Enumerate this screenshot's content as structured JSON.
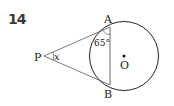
{
  "problem": {
    "number": "14"
  },
  "figure": {
    "points": {
      "P": "P",
      "A": "A",
      "B": "B",
      "O": "O"
    },
    "angle_at_A": "65°",
    "angle_at_P": "x",
    "stroke_color": "#222222"
  }
}
